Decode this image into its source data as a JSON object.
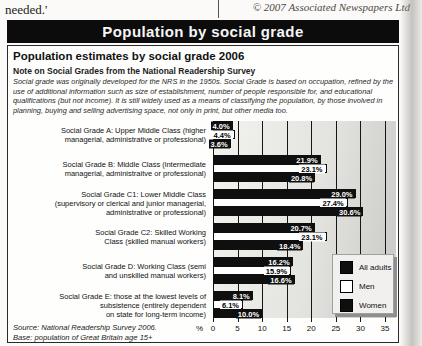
{
  "page": {
    "top_left_text": "needed.'",
    "copyright": "© 2007 Associated Newspapers Ltd"
  },
  "banner": {
    "title": "Population by social grade"
  },
  "header": {
    "title": "Population estimates by social grade 2006",
    "note_heading": "Note on Social Grades from the National Readership Survey",
    "note_body": "Social grade was originally developed for the NRS in the 1950s. Social Grade is based on occupation, refined by the\nuse of additional information such as size of establishment, number of people responsible for, and educational\nqualifications (but not income). It is still widely used as a means of classifying the population, by those involved in\nplanning, buying and selling advertising space, not only in print, but other media too."
  },
  "chart_data": {
    "type": "bar",
    "orientation": "horizontal",
    "title": "Population estimates by social grade 2006",
    "unit": "%",
    "xlabel": "%",
    "xlim": [
      0,
      35
    ],
    "x_ticks": [
      0,
      5,
      10,
      15,
      20,
      25,
      30,
      35
    ],
    "grid": true,
    "legend_position": "bottom-right",
    "categories": [
      "Social Grade A: Upper Middle Class (higher\nmanagerial, administrative or professional)",
      "Social Grade B: Middle Class (intermediate\nmanagerial, administraitve or professional)",
      "Social Grade C1: Lower Middle Class\n(supervisory or clerical and junior managerial,\nadministrative or professional)",
      "Social Grade C2: Skilled Working\nClass (skilled manual workers)",
      "Social Grade D: Working Class (semi\nand unskilled manual workers)",
      "Social Grade E: those at the lowest levels of\nsubsistence (entirely dependent\non state for long-term income)"
    ],
    "series": [
      {
        "name": "All adults",
        "color": "#0f0f0f",
        "style": "dark",
        "values": [
          4.0,
          21.9,
          29.0,
          20.7,
          16.2,
          8.1
        ]
      },
      {
        "name": "Men",
        "color": "#ffffff",
        "style": "light",
        "values": [
          4.4,
          23.1,
          27.4,
          23.1,
          15.9,
          6.1
        ]
      },
      {
        "name": "Women",
        "color": "#0f0f0f",
        "style": "dark",
        "values": [
          3.6,
          20.8,
          30.6,
          18.4,
          16.6,
          10.0
        ]
      }
    ]
  },
  "footer": {
    "source": "Source: National Readership Survey 2006.",
    "base": "Base: population of Great Britain age 15+"
  }
}
